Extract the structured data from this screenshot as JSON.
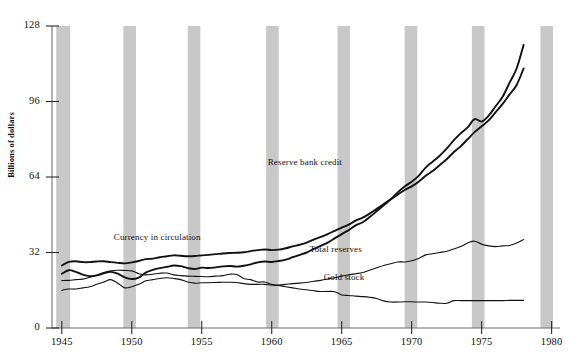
{
  "axes": {
    "ylabel": "Billions of dollars",
    "yticks": [
      0,
      32,
      64,
      96,
      128
    ],
    "ytick_labels": [
      "0",
      "32",
      "64",
      "96",
      "128"
    ],
    "xticks": [
      1945,
      1950,
      1955,
      1960,
      1965,
      1970,
      1975,
      1980
    ],
    "xtick_labels": [
      "1945",
      "1950",
      "1955",
      "1960",
      "1965",
      "1970",
      "1975",
      "1980"
    ]
  },
  "series_labels": {
    "reserve_bank_credit": "Reserve bank credit",
    "currency_in_circulation": "Currency in circulation",
    "total_reserves": "Total reserves",
    "gold_stock": "Gold stock"
  },
  "colors": {
    "line": "#111111",
    "band": "#c8c8c8",
    "axis": "#6f6f6f",
    "background": "#ffffff"
  },
  "chart_data": {
    "type": "line",
    "title": "",
    "xlabel": "",
    "ylabel": "Billions of dollars",
    "xlim": [
      1944.3,
      1980.6
    ],
    "ylim": [
      0,
      128
    ],
    "grid": false,
    "legend": "inline-annotations",
    "yticks": [
      0,
      32,
      64,
      96,
      128
    ],
    "xticks": [
      1945,
      1950,
      1955,
      1960,
      1965,
      1970,
      1975,
      1980
    ],
    "recession_bands": [
      {
        "start": 1944.6,
        "end": 1945.6
      },
      {
        "start": 1949.4,
        "end": 1950.3
      },
      {
        "start": 1954.0,
        "end": 1954.9
      },
      {
        "start": 1959.6,
        "end": 1960.5
      },
      {
        "start": 1964.7,
        "end": 1965.6
      },
      {
        "start": 1969.5,
        "end": 1970.4
      },
      {
        "start": 1974.3,
        "end": 1975.2
      },
      {
        "start": 1979.2,
        "end": 1980.1
      }
    ],
    "series": [
      {
        "name": "Reserve bank credit",
        "label_x": 1964.0,
        "label_y": 70,
        "linewidth": 1.9,
        "x": [
          1945,
          1945.5,
          1946,
          1946.5,
          1947,
          1947.5,
          1948,
          1948.5,
          1949,
          1949.5,
          1950,
          1950.5,
          1951,
          1951.5,
          1952,
          1952.5,
          1953,
          1953.5,
          1954,
          1954.5,
          1955,
          1955.5,
          1956,
          1956.5,
          1957,
          1957.5,
          1958,
          1958.5,
          1959,
          1959.5,
          1960,
          1960.5,
          1961,
          1961.5,
          1962,
          1962.5,
          1963,
          1963.5,
          1964,
          1964.5,
          1965,
          1965.5,
          1966,
          1966.5,
          1967,
          1967.5,
          1968,
          1968.5,
          1969,
          1969.5,
          1970,
          1970.5,
          1971,
          1971.5,
          1972,
          1972.5,
          1973,
          1973.5,
          1974,
          1974.5,
          1975,
          1975.5,
          1976,
          1976.5,
          1977,
          1977.5,
          1978
        ],
        "values": [
          23.0,
          24.5,
          23.8,
          22.6,
          22.0,
          22.3,
          23.2,
          23.8,
          23.0,
          21.5,
          20.8,
          21.4,
          23.5,
          24.6,
          25.4,
          25.9,
          26.5,
          26.2,
          25.4,
          25.0,
          25.6,
          25.4,
          25.7,
          26.1,
          26.3,
          26.0,
          26.4,
          27.0,
          27.8,
          28.2,
          28.0,
          28.4,
          29.0,
          30.0,
          31.0,
          32.0,
          33.5,
          34.8,
          36.2,
          38.0,
          39.8,
          41.5,
          43.5,
          44.8,
          47.0,
          49.5,
          52.0,
          54.5,
          57.5,
          60.0,
          62.0,
          64.5,
          68.0,
          70.5,
          73.0,
          76.0,
          79.5,
          82.5,
          85.0,
          88.5,
          87.5,
          90.0,
          94.0,
          98.0,
          104.0,
          110.0,
          120.0
        ]
      },
      {
        "name": "Currency in circulation",
        "label_x": 1953.0,
        "label_y": 38,
        "linewidth": 1.9,
        "x": [
          1945,
          1945.5,
          1946,
          1946.5,
          1947,
          1947.5,
          1948,
          1948.5,
          1949,
          1949.5,
          1950,
          1950.5,
          1951,
          1951.5,
          1952,
          1952.5,
          1953,
          1953.5,
          1954,
          1954.5,
          1955,
          1955.5,
          1956,
          1956.5,
          1957,
          1957.5,
          1958,
          1958.5,
          1959,
          1959.5,
          1960,
          1960.5,
          1961,
          1961.5,
          1962,
          1962.5,
          1963,
          1963.5,
          1964,
          1964.5,
          1965,
          1965.5,
          1966,
          1966.5,
          1967,
          1967.5,
          1968,
          1968.5,
          1969,
          1969.5,
          1970,
          1970.5,
          1971,
          1971.5,
          1972,
          1972.5,
          1973,
          1973.5,
          1974,
          1974.5,
          1975,
          1975.5,
          1976,
          1976.5,
          1977,
          1977.5,
          1978
        ],
        "values": [
          26.5,
          28.0,
          28.3,
          27.9,
          27.9,
          28.2,
          28.3,
          27.9,
          27.6,
          27.4,
          27.8,
          28.4,
          29.2,
          29.4,
          30.0,
          30.4,
          30.8,
          30.6,
          30.4,
          30.5,
          30.8,
          31.0,
          31.3,
          31.6,
          31.8,
          31.9,
          32.1,
          32.6,
          33.0,
          33.3,
          33.0,
          33.2,
          33.8,
          34.6,
          35.3,
          36.2,
          37.5,
          38.6,
          39.8,
          41.2,
          42.5,
          43.8,
          45.5,
          46.8,
          48.5,
          50.5,
          52.5,
          54.5,
          56.5,
          58.5,
          60.0,
          62.0,
          64.5,
          66.5,
          69.0,
          71.5,
          74.5,
          77.0,
          80.0,
          83.0,
          85.5,
          88.0,
          91.5,
          95.0,
          99.0,
          103.0,
          110.0
        ]
      },
      {
        "name": "Total reserves",
        "label_x": 1967.0,
        "label_y": 33,
        "linewidth": 1.1,
        "x": [
          1945,
          1945.5,
          1946,
          1946.5,
          1947,
          1947.5,
          1948,
          1948.5,
          1949,
          1949.5,
          1950,
          1950.5,
          1951,
          1951.5,
          1952,
          1952.5,
          1953,
          1953.5,
          1954,
          1954.5,
          1955,
          1955.5,
          1956,
          1956.5,
          1957,
          1957.5,
          1958,
          1958.5,
          1959,
          1959.5,
          1960,
          1960.5,
          1961,
          1961.5,
          1962,
          1962.5,
          1963,
          1963.5,
          1964,
          1964.5,
          1965,
          1965.5,
          1966,
          1966.5,
          1967,
          1967.5,
          1968,
          1968.5,
          1969,
          1969.5,
          1970,
          1970.5,
          1971,
          1971.5,
          1972,
          1972.5,
          1973,
          1973.5,
          1974,
          1974.5,
          1975,
          1975.5,
          1976,
          1976.5,
          1977,
          1977.5,
          1978
        ],
        "values": [
          16.0,
          16.5,
          16.5,
          17.0,
          17.5,
          18.5,
          19.5,
          20.5,
          19.0,
          17.0,
          17.5,
          18.5,
          20.0,
          20.5,
          21.0,
          21.3,
          21.0,
          20.5,
          19.5,
          19.0,
          19.2,
          19.2,
          19.3,
          19.4,
          19.4,
          19.3,
          18.8,
          18.5,
          18.5,
          18.5,
          18.2,
          18.2,
          18.5,
          18.8,
          19.0,
          19.3,
          19.8,
          20.2,
          20.8,
          21.3,
          22.0,
          22.5,
          23.0,
          23.5,
          24.5,
          25.5,
          26.5,
          27.2,
          28.0,
          28.0,
          28.5,
          29.5,
          31.0,
          31.5,
          32.0,
          32.5,
          33.5,
          34.5,
          36.0,
          36.8,
          35.5,
          34.8,
          34.5,
          34.8,
          35.0,
          36.0,
          37.5
        ]
      },
      {
        "name": "Gold stock",
        "label_x": 1968.0,
        "label_y": 21,
        "linewidth": 1.1,
        "x": [
          1945,
          1945.5,
          1946,
          1946.5,
          1947,
          1947.5,
          1948,
          1948.5,
          1949,
          1949.5,
          1950,
          1950.5,
          1951,
          1951.5,
          1952,
          1952.5,
          1953,
          1953.5,
          1954,
          1954.5,
          1955,
          1955.5,
          1956,
          1956.5,
          1957,
          1957.5,
          1958,
          1958.5,
          1959,
          1959.5,
          1960,
          1960.5,
          1961,
          1961.5,
          1962,
          1962.5,
          1963,
          1963.5,
          1964,
          1964.5,
          1965,
          1965.5,
          1966,
          1966.5,
          1967,
          1967.5,
          1968,
          1968.5,
          1969,
          1969.5,
          1970,
          1970.5,
          1971,
          1971.5,
          1972,
          1972.5,
          1973,
          1973.5,
          1974,
          1974.5,
          1975,
          1975.5,
          1976,
          1976.5,
          1977,
          1977.5,
          1978
        ],
        "values": [
          20.1,
          20.2,
          20.5,
          20.7,
          21.5,
          22.3,
          23.5,
          24.2,
          24.5,
          24.4,
          24.2,
          23.0,
          22.5,
          22.8,
          23.2,
          23.3,
          22.5,
          22.2,
          22.0,
          21.9,
          21.8,
          21.7,
          22.0,
          22.2,
          22.8,
          22.7,
          21.0,
          20.5,
          19.5,
          19.5,
          18.5,
          18.0,
          17.5,
          17.0,
          16.5,
          16.2,
          15.8,
          15.5,
          15.5,
          15.4,
          14.0,
          13.8,
          13.5,
          13.3,
          13.0,
          12.5,
          11.5,
          11.0,
          11.0,
          11.1,
          11.1,
          11.0,
          11.0,
          10.8,
          10.5,
          10.5,
          11.6,
          11.6,
          11.6,
          11.6,
          11.6,
          11.6,
          11.6,
          11.6,
          11.7,
          11.7,
          11.7
        ]
      }
    ]
  }
}
